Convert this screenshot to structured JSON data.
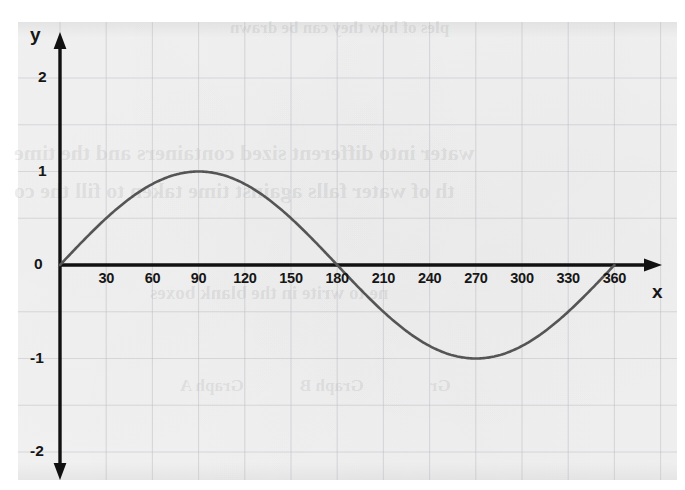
{
  "figure": {
    "kind": "scanned-textbook-graph",
    "background_color": "#f3f3f3",
    "page_color": "#ffffff",
    "curve_color": "#555555",
    "axis_color": "#111111",
    "grid_color": "#b9b9c4",
    "label_color": "#161616"
  },
  "axes": {
    "x_name": "x",
    "y_name": "y"
  },
  "chart_data": {
    "type": "line",
    "title": "",
    "subtitle": "",
    "xlabel": "x",
    "ylabel": "y",
    "xlim": [
      0,
      375
    ],
    "ylim": [
      -2,
      2
    ],
    "grid": true,
    "legend": null,
    "x_ticks": [
      30,
      60,
      90,
      120,
      150,
      180,
      210,
      240,
      270,
      300,
      330,
      360
    ],
    "x_tick_labels": [
      "30",
      "60",
      "90",
      "120",
      "150",
      "180",
      "210",
      "240",
      "270",
      "300",
      "330",
      "360"
    ],
    "y_ticks": [
      2,
      1,
      0,
      -1,
      -2
    ],
    "y_tick_labels": [
      "2",
      "1",
      "0",
      "-1",
      "-2"
    ],
    "x_grid_step": 30,
    "y_grid_step": 0.5,
    "series": [
      {
        "name": "y = sin(x)",
        "equation": "sin",
        "amplitude": 1,
        "period_degrees": 360,
        "phase_degrees": 0,
        "x": [
          0,
          10,
          20,
          30,
          40,
          50,
          60,
          70,
          80,
          90,
          100,
          110,
          120,
          130,
          140,
          150,
          160,
          170,
          180,
          190,
          200,
          210,
          220,
          230,
          240,
          250,
          260,
          270,
          280,
          290,
          300,
          310,
          320,
          330,
          340,
          350,
          360
        ],
        "values": [
          0,
          0.174,
          0.342,
          0.5,
          0.643,
          0.766,
          0.866,
          0.94,
          0.985,
          1,
          0.985,
          0.94,
          0.866,
          0.766,
          0.643,
          0.5,
          0.342,
          0.174,
          0,
          -0.174,
          -0.342,
          -0.5,
          -0.643,
          -0.766,
          -0.866,
          -0.94,
          -0.985,
          -1,
          -0.985,
          -0.94,
          -0.866,
          -0.766,
          -0.643,
          -0.5,
          -0.342,
          -0.174,
          0
        ]
      }
    ],
    "key_points": {
      "maximum": {
        "x": 90,
        "y": 1
      },
      "minimum": {
        "x": 270,
        "y": -1
      },
      "zeros": [
        0,
        180,
        360
      ]
    }
  },
  "ghost_text": {
    "line1": "ples of how they can be drawn",
    "line2": "water into different sized containers and the time",
    "line3": "th of water falls against time taken to fill the co",
    "line4": "ne to write in the blank boxes",
    "line5": "Graph A",
    "line6": "Graph B",
    "line7": "Gr"
  }
}
